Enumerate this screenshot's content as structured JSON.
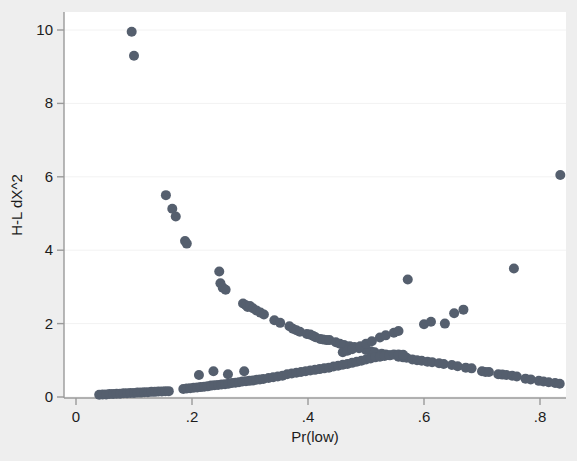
{
  "chart_data": {
    "type": "scatter",
    "title": "",
    "subtitle": "",
    "xlabel": "Pr(low)",
    "ylabel": "H-L dX^2",
    "xlim": [
      0.0,
      0.87
    ],
    "ylim": [
      -0.35,
      10.45
    ],
    "xticks": [
      0,
      0.2,
      0.4,
      0.6,
      0.8
    ],
    "xtick_labels": [
      "0",
      ".2",
      ".4",
      ".6",
      ".8"
    ],
    "yticks": [
      0,
      2,
      4,
      6,
      8,
      10
    ],
    "ytick_labels": [
      "0",
      "2",
      "4",
      "6",
      "8",
      "10"
    ],
    "grid": "horizontal-faint",
    "legend": "none",
    "marker": {
      "shape": "circle",
      "color": "#555f6e",
      "size_px": 5.0
    },
    "background": {
      "figure": "#eeeeee",
      "plot_area": "#ffffff",
      "frame_color": "#9a9a9a",
      "grid_color": "#f2f2f2"
    },
    "series": [
      {
        "name": "decreasing-branch",
        "points": [
          [
            0.096,
            9.95
          ],
          [
            0.1,
            9.3
          ],
          [
            0.155,
            5.5
          ],
          [
            0.166,
            5.13
          ],
          [
            0.172,
            4.92
          ],
          [
            0.188,
            4.25
          ],
          [
            0.191,
            4.18
          ],
          [
            0.247,
            3.42
          ],
          [
            0.249,
            3.1
          ],
          [
            0.253,
            2.98
          ],
          [
            0.258,
            2.92
          ],
          [
            0.288,
            2.55
          ],
          [
            0.293,
            2.5
          ],
          [
            0.296,
            2.45
          ],
          [
            0.3,
            2.48
          ],
          [
            0.305,
            2.42
          ],
          [
            0.311,
            2.36
          ],
          [
            0.318,
            2.3
          ],
          [
            0.324,
            2.25
          ],
          [
            0.342,
            2.09
          ],
          [
            0.352,
            2.02
          ],
          [
            0.368,
            1.93
          ],
          [
            0.374,
            1.86
          ],
          [
            0.38,
            1.82
          ],
          [
            0.386,
            1.78
          ],
          [
            0.398,
            1.72
          ],
          [
            0.404,
            1.7
          ],
          [
            0.409,
            1.66
          ],
          [
            0.413,
            1.63
          ],
          [
            0.421,
            1.58
          ],
          [
            0.426,
            1.57
          ],
          [
            0.432,
            1.55
          ],
          [
            0.437,
            1.55
          ],
          [
            0.448,
            1.49
          ],
          [
            0.455,
            1.45
          ],
          [
            0.462,
            1.42
          ],
          [
            0.472,
            1.38
          ],
          [
            0.48,
            1.36
          ],
          [
            0.488,
            1.33
          ],
          [
            0.5,
            1.28
          ],
          [
            0.508,
            1.25
          ],
          [
            0.515,
            1.22
          ],
          [
            0.527,
            1.18
          ],
          [
            0.534,
            1.16
          ],
          [
            0.542,
            1.14
          ],
          [
            0.556,
            1.1
          ],
          [
            0.564,
            1.08
          ],
          [
            0.57,
            1.07
          ],
          [
            0.58,
            1.02
          ],
          [
            0.588,
            1.0
          ],
          [
            0.596,
            0.99
          ],
          [
            0.606,
            0.96
          ],
          [
            0.614,
            0.95
          ],
          [
            0.626,
            0.92
          ],
          [
            0.634,
            0.9
          ],
          [
            0.648,
            0.87
          ],
          [
            0.658,
            0.84
          ],
          [
            0.672,
            0.8
          ],
          [
            0.682,
            0.78
          ],
          [
            0.7,
            0.7
          ],
          [
            0.706,
            0.68
          ],
          [
            0.712,
            0.68
          ],
          [
            0.728,
            0.62
          ],
          [
            0.735,
            0.61
          ],
          [
            0.742,
            0.6
          ],
          [
            0.752,
            0.58
          ],
          [
            0.76,
            0.56
          ],
          [
            0.775,
            0.5
          ],
          [
            0.784,
            0.48
          ],
          [
            0.798,
            0.44
          ],
          [
            0.806,
            0.42
          ],
          [
            0.815,
            0.4
          ],
          [
            0.826,
            0.38
          ],
          [
            0.834,
            0.36
          ]
        ]
      },
      {
        "name": "increasing-branch",
        "points": [
          [
            0.04,
            0.06
          ],
          [
            0.046,
            0.07
          ],
          [
            0.052,
            0.07
          ],
          [
            0.058,
            0.08
          ],
          [
            0.064,
            0.08
          ],
          [
            0.07,
            0.09
          ],
          [
            0.076,
            0.09
          ],
          [
            0.082,
            0.1
          ],
          [
            0.088,
            0.1
          ],
          [
            0.094,
            0.11
          ],
          [
            0.1,
            0.11
          ],
          [
            0.106,
            0.12
          ],
          [
            0.112,
            0.12
          ],
          [
            0.118,
            0.13
          ],
          [
            0.124,
            0.13
          ],
          [
            0.13,
            0.14
          ],
          [
            0.136,
            0.14
          ],
          [
            0.142,
            0.15
          ],
          [
            0.148,
            0.15
          ],
          [
            0.154,
            0.16
          ],
          [
            0.16,
            0.16
          ],
          [
            0.185,
            0.22
          ],
          [
            0.191,
            0.23
          ],
          [
            0.197,
            0.24
          ],
          [
            0.203,
            0.25
          ],
          [
            0.209,
            0.26
          ],
          [
            0.215,
            0.27
          ],
          [
            0.221,
            0.28
          ],
          [
            0.227,
            0.29
          ],
          [
            0.233,
            0.31
          ],
          [
            0.239,
            0.32
          ],
          [
            0.245,
            0.33
          ],
          [
            0.251,
            0.34
          ],
          [
            0.257,
            0.35
          ],
          [
            0.263,
            0.36
          ],
          [
            0.269,
            0.38
          ],
          [
            0.275,
            0.39
          ],
          [
            0.281,
            0.4
          ],
          [
            0.287,
            0.42
          ],
          [
            0.293,
            0.43
          ],
          [
            0.299,
            0.44
          ],
          [
            0.305,
            0.45
          ],
          [
            0.311,
            0.47
          ],
          [
            0.317,
            0.48
          ],
          [
            0.323,
            0.49
          ],
          [
            0.212,
            0.6
          ],
          [
            0.237,
            0.7
          ],
          [
            0.262,
            0.62
          ],
          [
            0.29,
            0.7
          ],
          [
            0.332,
            0.52
          ],
          [
            0.34,
            0.54
          ],
          [
            0.348,
            0.56
          ],
          [
            0.356,
            0.58
          ],
          [
            0.364,
            0.62
          ],
          [
            0.372,
            0.64
          ],
          [
            0.38,
            0.66
          ],
          [
            0.388,
            0.68
          ],
          [
            0.396,
            0.7
          ],
          [
            0.404,
            0.72
          ],
          [
            0.412,
            0.74
          ],
          [
            0.42,
            0.76
          ],
          [
            0.428,
            0.78
          ],
          [
            0.436,
            0.8
          ],
          [
            0.444,
            0.83
          ],
          [
            0.452,
            0.85
          ],
          [
            0.46,
            0.88
          ],
          [
            0.468,
            0.9
          ],
          [
            0.476,
            0.93
          ],
          [
            0.484,
            0.96
          ],
          [
            0.492,
            0.99
          ],
          [
            0.5,
            1.02
          ],
          [
            0.508,
            1.05
          ],
          [
            0.516,
            1.08
          ],
          [
            0.524,
            1.1
          ],
          [
            0.532,
            1.12
          ],
          [
            0.54,
            1.14
          ],
          [
            0.548,
            1.16
          ],
          [
            0.556,
            1.16
          ],
          [
            0.564,
            1.15
          ],
          [
            0.46,
            1.22
          ],
          [
            0.468,
            1.26
          ],
          [
            0.476,
            1.3
          ],
          [
            0.49,
            1.38
          ],
          [
            0.5,
            1.45
          ],
          [
            0.51,
            1.52
          ],
          [
            0.524,
            1.62
          ],
          [
            0.534,
            1.68
          ],
          [
            0.548,
            1.75
          ],
          [
            0.556,
            1.8
          ],
          [
            0.572,
            3.2
          ],
          [
            0.6,
            1.98
          ],
          [
            0.612,
            2.05
          ],
          [
            0.636,
            2.0
          ],
          [
            0.652,
            2.28
          ],
          [
            0.668,
            2.38
          ],
          [
            0.755,
            3.5
          ],
          [
            0.835,
            6.05
          ]
        ]
      }
    ]
  }
}
